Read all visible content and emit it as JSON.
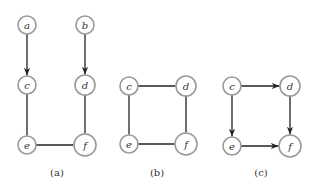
{
  "panels": [
    {
      "caption": "(a)",
      "nodes": [
        {
          "id": "a",
          "x": 27,
          "y": 25,
          "r": 9
        },
        {
          "id": "b",
          "x": 85,
          "y": 25,
          "r": 9
        },
        {
          "id": "c",
          "x": 27,
          "y": 85,
          "r": 9
        },
        {
          "id": "d",
          "x": 85,
          "y": 85,
          "r": 10
        },
        {
          "id": "e",
          "x": 27,
          "y": 145,
          "r": 9
        },
        {
          "id": "f",
          "x": 85,
          "y": 145,
          "r": 11
        }
      ],
      "edges": [
        {
          "from": "a",
          "to": "c",
          "directed": true
        },
        {
          "from": "b",
          "to": "d",
          "directed": true
        },
        {
          "from": "c",
          "to": "e",
          "directed": false
        },
        {
          "from": "d",
          "to": "f",
          "directed": false
        },
        {
          "from": "e",
          "to": "f",
          "directed": false
        }
      ],
      "caption_x": 57,
      "caption_y": 176
    },
    {
      "caption": "(b)",
      "nodes": [
        {
          "id": "c",
          "x": 129,
          "y": 86,
          "r": 9
        },
        {
          "id": "d",
          "x": 186,
          "y": 86,
          "r": 10
        },
        {
          "id": "e",
          "x": 129,
          "y": 144,
          "r": 9
        },
        {
          "id": "f",
          "x": 186,
          "y": 144,
          "r": 11
        }
      ],
      "edges": [
        {
          "from": "c",
          "to": "d",
          "directed": false
        },
        {
          "from": "c",
          "to": "e",
          "directed": false
        },
        {
          "from": "d",
          "to": "f",
          "directed": false
        },
        {
          "from": "e",
          "to": "f",
          "directed": false
        }
      ],
      "caption_x": 157,
      "caption_y": 176
    },
    {
      "caption": "(c)",
      "nodes": [
        {
          "id": "c",
          "x": 232,
          "y": 86,
          "r": 9
        },
        {
          "id": "d",
          "x": 290,
          "y": 86,
          "r": 10
        },
        {
          "id": "e",
          "x": 232,
          "y": 146,
          "r": 9
        },
        {
          "id": "f",
          "x": 290,
          "y": 146,
          "r": 11
        }
      ],
      "edges": [
        {
          "from": "c",
          "to": "d",
          "directed": true
        },
        {
          "from": "c",
          "to": "e",
          "directed": true
        },
        {
          "from": "d",
          "to": "f",
          "directed": true
        },
        {
          "from": "e",
          "to": "f",
          "directed": true
        }
      ],
      "caption_x": 261,
      "caption_y": 176
    }
  ]
}
